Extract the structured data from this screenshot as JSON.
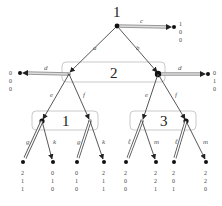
{
  "diagram": {
    "type": "extensive-form game tree",
    "players": {
      "root": "1",
      "infoset_2": "2",
      "infoset_left": "1",
      "infoset_right": "3"
    },
    "actions": {
      "root_left": "a",
      "root_right": "b",
      "root_exit": "c",
      "p2_left_exit": "d",
      "p2_right_exit": "d",
      "p2_left_e": "e",
      "p2_left_f": "f",
      "p2_right_e": "e",
      "p2_right_f": "f",
      "p1_left_g": "g",
      "p1_left_k": "k",
      "p1_right_g": "g",
      "p1_right_k": "k",
      "p3_left_l": "ℓ",
      "p3_left_m": "m",
      "p3_right_l": "ℓ",
      "p3_right_m": "m"
    },
    "payoffs": {
      "c": [
        "1",
        "0",
        "0"
      ],
      "d_left": [
        "0",
        "0",
        "0"
      ],
      "d_right": [
        "0",
        "1",
        "0"
      ],
      "leaf1": [
        "2",
        "1",
        "1"
      ],
      "leaf2": [
        "0",
        "1",
        "0"
      ],
      "leaf3": [
        "0",
        "1",
        "0"
      ],
      "leaf4": [
        "2",
        "1",
        "1"
      ],
      "leaf5": [
        "2",
        "0",
        "0"
      ],
      "leaf6": [
        "2",
        "2",
        "1"
      ],
      "leaf7": [
        "2",
        "0",
        "1"
      ],
      "leaf8": [
        "2",
        "2",
        "0"
      ]
    }
  }
}
